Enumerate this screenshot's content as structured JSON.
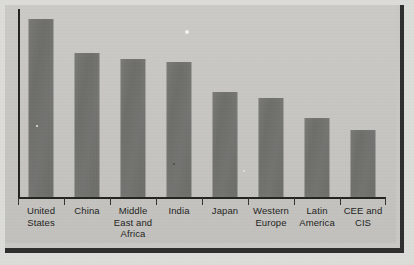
{
  "figure": {
    "background_color": "#c9c8c5",
    "bar_color": "#6f6f6b",
    "axis_color": "#23231f",
    "label_color": "#1e1e1c",
    "frame_shadow_color": "#2e2e2c",
    "page_color": "#dcdcd8"
  },
  "chart_data": {
    "type": "bar",
    "title": "",
    "subtitle": "",
    "xlabel": "",
    "ylabel": "",
    "grid": false,
    "legend": "none",
    "axis": {
      "y_ticks_labeled": false,
      "x_ticks_labeled": true,
      "ylim": [
        0,
        100
      ]
    },
    "categories": [
      "United\nStates",
      "China",
      "Middle\nEast and\nAfrica",
      "India",
      "Japan",
      "Western\nEurope",
      "Latin\nAmerica",
      "CEE and\nCIS"
    ],
    "values": [
      100,
      81,
      78,
      76,
      59,
      56,
      45,
      38
    ],
    "bar_pixel_heights": [
      179,
      145,
      139,
      136,
      106,
      100,
      80,
      68
    ]
  },
  "labels": {
    "united_states": "United\nStates",
    "china": "China",
    "middle_east_and_africa": "Middle\nEast and\nAfrica",
    "india": "India",
    "japan": "Japan",
    "western_europe": "Western\nEurope",
    "latin_america": "Latin\nAmerica",
    "cee_and_cis": "CEE and\nCIS"
  }
}
